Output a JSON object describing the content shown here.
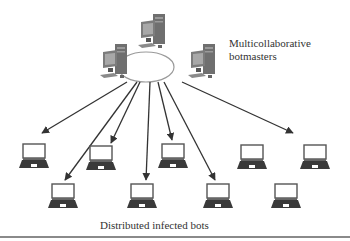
{
  "diagram": {
    "botmasters_label_line1": "Multicollaborative",
    "botmasters_label_line2": "botmasters",
    "bots_label": "Distributed infected bots",
    "botmasters": [
      {
        "id": "botmaster-top",
        "icon": "desktop-computer-icon",
        "x": 140,
        "y": 16
      },
      {
        "id": "botmaster-left",
        "icon": "desktop-computer-icon",
        "x": 100,
        "y": 44
      },
      {
        "id": "botmaster-right",
        "icon": "desktop-computer-icon",
        "x": 188,
        "y": 44
      }
    ],
    "network_ellipse": {
      "cx": 146,
      "cy": 67,
      "rx": 28,
      "ry": 15
    },
    "bots": [
      {
        "id": "bot-1",
        "row": 1,
        "x": 20,
        "y": 144
      },
      {
        "id": "bot-2",
        "row": 1,
        "x": 86,
        "y": 146
      },
      {
        "id": "bot-3",
        "row": 1,
        "x": 158,
        "y": 144
      },
      {
        "id": "bot-4",
        "row": 1,
        "x": 237,
        "y": 145
      },
      {
        "id": "bot-5",
        "row": 1,
        "x": 300,
        "y": 145
      },
      {
        "id": "bot-6",
        "row": 2,
        "x": 50,
        "y": 184
      },
      {
        "id": "bot-7",
        "row": 2,
        "x": 128,
        "y": 184
      },
      {
        "id": "bot-8",
        "row": 2,
        "x": 204,
        "y": 184
      },
      {
        "id": "bot-9",
        "row": 2,
        "x": 272,
        "y": 184
      }
    ],
    "arrows": [
      {
        "x1": 127,
        "y1": 82,
        "x2": 42,
        "y2": 133
      },
      {
        "x1": 137,
        "y1": 82,
        "x2": 65,
        "y2": 180
      },
      {
        "x1": 140,
        "y1": 82,
        "x2": 111,
        "y2": 143
      },
      {
        "x1": 150,
        "y1": 82,
        "x2": 146,
        "y2": 180
      },
      {
        "x1": 158,
        "y1": 82,
        "x2": 172,
        "y2": 140
      },
      {
        "x1": 164,
        "y1": 82,
        "x2": 215,
        "y2": 180
      },
      {
        "x1": 182,
        "y1": 82,
        "x2": 293,
        "y2": 133
      }
    ],
    "colors": {
      "arrow": "#333333",
      "ellipse_stroke": "#9a9a9a",
      "laptop_screen_border": "#555555",
      "laptop_base": "#3a3a3a",
      "text": "#333333",
      "desktop_tower": "#6f6f6f",
      "desktop_monitor": "#7c7c7c"
    }
  }
}
